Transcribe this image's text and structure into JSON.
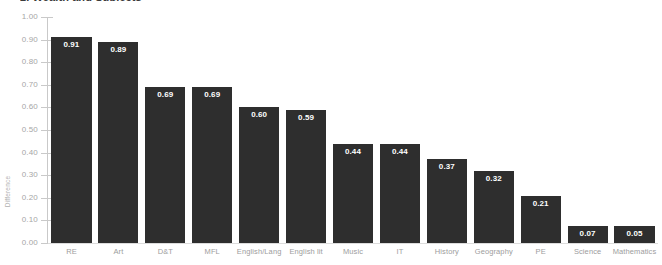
{
  "title": "2. Wealth and Subjects",
  "axis": {
    "y_title": "Difference",
    "y_ticks": [
      "1.00",
      "0.90",
      "0.80",
      "0.70",
      "0.60",
      "0.50",
      "0.40",
      "0.30",
      "0.20",
      "0.10",
      "0.00"
    ]
  },
  "colors": {
    "bar": "#2e2e2e",
    "value_label": "#ffffff",
    "axis": "#c9c9c9",
    "tick_text": "#a6a6a6",
    "category_text": "#9d9d9d",
    "background": "#ffffff"
  },
  "chart_data": {
    "type": "bar",
    "title": "2. Wealth and Subjects",
    "xlabel": "",
    "ylabel": "Difference",
    "ylim": [
      0,
      1.0
    ],
    "ytick_step": 0.1,
    "grid": false,
    "legend": null,
    "orientation": "vertical",
    "sorted": "descending",
    "categories": [
      "RE",
      "Art",
      "D&T",
      "MFL",
      "English/Lang",
      "English lit",
      "Music",
      "IT",
      "History",
      "Geography",
      "PE",
      "Science",
      "Mathematics"
    ],
    "values": [
      0.91,
      0.89,
      0.69,
      0.69,
      0.6,
      0.59,
      0.44,
      0.44,
      0.37,
      0.32,
      0.21,
      0.07,
      0.05
    ],
    "value_labels": [
      "0.91",
      "0.89",
      "0.69",
      "0.69",
      "0.60",
      "0.59",
      "0.44",
      "0.44",
      "0.37",
      "0.32",
      "0.21",
      "0.07",
      "0.05"
    ]
  }
}
